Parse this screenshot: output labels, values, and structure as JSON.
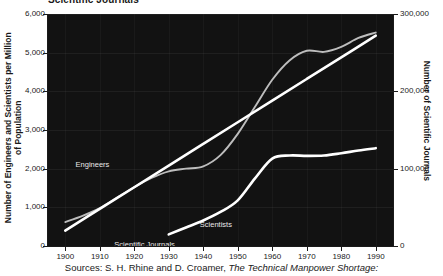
{
  "chart_data": {
    "type": "line",
    "title": "Scientific Journals",
    "xlabel": "",
    "ylabel": "Number of Engineers and Scientists per Million of Population",
    "y2label": "Number of Scientific Journals",
    "x": [
      1900,
      1910,
      1920,
      1930,
      1940,
      1950,
      1960,
      1970,
      1980,
      1990
    ],
    "xlim": [
      1895,
      1995
    ],
    "ylim": [
      0,
      6000
    ],
    "y2lim": [
      0,
      300000
    ],
    "grid": true,
    "legend_position": "in-plot-annotations",
    "background": "#121212",
    "xticklabels": [
      "1900",
      "1910",
      "1920",
      "1930",
      "1940",
      "1950",
      "1960",
      "1970",
      "1980",
      "1990"
    ],
    "yticklabels": [
      "0",
      "1,000",
      "2,000",
      "3,000",
      "4,000",
      "5,000",
      "6,000"
    ],
    "ytickvalues": [
      0,
      1000,
      2000,
      3000,
      4000,
      5000,
      6000
    ],
    "y2ticklabels": [
      "0",
      "100,000",
      "200,000",
      "300,000"
    ],
    "y2tickvalues": [
      0,
      100000,
      200000,
      300000
    ],
    "series": [
      {
        "name": "Engineers",
        "axis": "left",
        "color": "#bdbdbd",
        "label_x": 1903,
        "label_y": 2080,
        "x": [
          1900,
          1905,
          1910,
          1915,
          1920,
          1925,
          1930,
          1935,
          1940,
          1945,
          1950,
          1955,
          1960,
          1965,
          1970,
          1975,
          1980,
          1985,
          1990
        ],
        "values": [
          620,
          780,
          980,
          1250,
          1520,
          1760,
          1930,
          2000,
          2060,
          2350,
          2900,
          3600,
          4300,
          4800,
          5050,
          5020,
          5150,
          5380,
          5520
        ]
      },
      {
        "name": "Scientific Journals",
        "axis": "right",
        "color": "#ffffff",
        "label_x": 1923,
        "label_y": 600,
        "label_sub": "(right axis)",
        "x": [
          1900,
          1910,
          1920,
          1930,
          1940,
          1950,
          1960,
          1970,
          1980,
          1990
        ],
        "values": [
          20000,
          48000,
          76000,
          104000,
          132000,
          160000,
          188000,
          216000,
          244000,
          272000
        ]
      },
      {
        "name": "Scientists",
        "axis": "left",
        "color": "#ffffff",
        "label_x": 1939,
        "label_y": 520,
        "x": [
          1930,
          1935,
          1940,
          1945,
          1950,
          1955,
          1960,
          1965,
          1970,
          1975,
          1980,
          1985,
          1990
        ],
        "values": [
          300,
          480,
          660,
          880,
          1180,
          1750,
          2260,
          2340,
          2330,
          2340,
          2400,
          2470,
          2530
        ]
      }
    ],
    "source_prefix": "Sources: S. H. Rhine and D. Croamer, ",
    "source_italic": "The Technical Manpower Shortage:"
  }
}
